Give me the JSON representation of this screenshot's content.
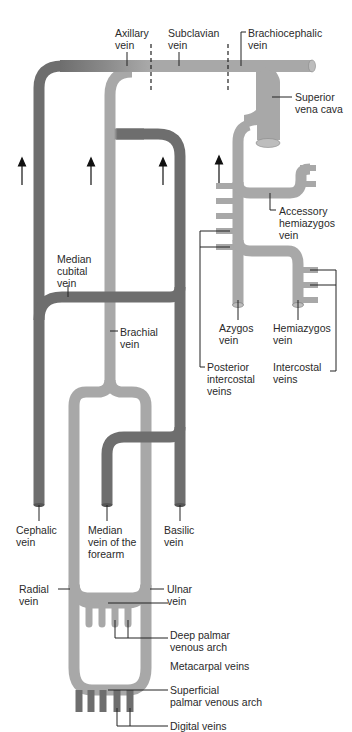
{
  "colors": {
    "deep_vein": "#a8a8a8",
    "superficial_vein": "#6e6e6e",
    "leader_line": "#222222",
    "background": "#ffffff"
  },
  "labels": {
    "axillary_vein": "Axillary\nvein",
    "subclavian_vein": "Subclavian\nvein",
    "brachiocephalic_vein": "Brachiocephalic\nvein",
    "superior_vena_cava": "Superior\nvena cava",
    "accessory_hemiazygos_vein": "Accessory\nhemiazygos\nvein",
    "median_cubital_vein": "Median\ncubital\nvein",
    "brachial_vein": "Brachial\nvein",
    "azygos_vein": "Azygos\nvein",
    "hemiazygos_vein": "Hemiazygos\nvein",
    "posterior_intercostal_veins": "Posterior\nintercostal\nveins",
    "intercostal_veins": "Intercostal\nveins",
    "cephalic_vein": "Cephalic\nvein",
    "median_vein_of_forearm": "Median\nvein of the\nforearm",
    "basilic_vein": "Basilic\nvein",
    "radial_vein": "Radial\nvein",
    "ulnar_vein": "Ulnar\nvein",
    "deep_palmar_venous_arch": "Deep palmar\nvenous arch",
    "metacarpal_veins": "Metacarpal veins",
    "superficial_palmar_venous_arch": "Superficial\npalmar venous arch",
    "digital_veins": "Digital veins"
  },
  "flow_arrows": [
    {
      "name": "cephalic-flow-arrow",
      "direction": "up"
    },
    {
      "name": "brachial-flow-arrow",
      "direction": "up"
    },
    {
      "name": "basilic-flow-arrow",
      "direction": "up"
    },
    {
      "name": "azygos-flow-arrow",
      "direction": "up"
    }
  ],
  "boundary_markers": [
    {
      "name": "axillary-subclavian-boundary",
      "style": "dashed"
    },
    {
      "name": "subclavian-brachiocephalic-boundary",
      "style": "dashed"
    }
  ]
}
